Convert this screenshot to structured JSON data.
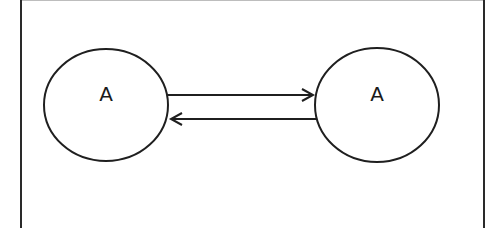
{
  "diagram": {
    "type": "state-diagram",
    "frame": {
      "left": 21,
      "right": 484,
      "top": 1,
      "border_color": "#2a2a2a",
      "top_border_color": "#bdbdbd"
    },
    "stroke_color": "#1f1f1f",
    "nodes": [
      {
        "id": "node-left",
        "label": "A",
        "cx": 106,
        "cy": 105,
        "rx": 62,
        "ry": 56
      },
      {
        "id": "node-right",
        "label": "A",
        "cx": 377,
        "cy": 105,
        "rx": 62,
        "ry": 57
      }
    ],
    "edges": [
      {
        "id": "edge-left-to-right",
        "from": "node-left",
        "to": "node-right",
        "x1": 168,
        "y1": 95,
        "x2": 313,
        "y2": 95,
        "direction": "right"
      },
      {
        "id": "edge-right-to-left",
        "from": "node-right",
        "to": "node-left",
        "x1": 316,
        "y1": 119,
        "x2": 171,
        "y2": 119,
        "direction": "left"
      }
    ]
  }
}
